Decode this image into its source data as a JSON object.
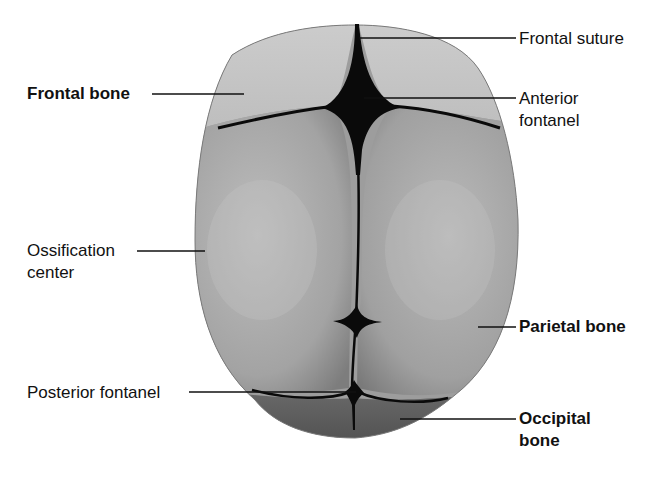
{
  "figure": {
    "colors": {
      "background": "#ffffff",
      "bone_light": "#c9c9c9",
      "bone_mid": "#a8a8a8",
      "bone_dark": "#6e6e6e",
      "suture": "#0a0a0a",
      "leader_line": "#111111",
      "text": "#111111"
    }
  },
  "labels": {
    "frontal_bone": {
      "text": "Frontal bone",
      "bold": true,
      "side": "left"
    },
    "frontal_suture": {
      "text": "Frontal suture",
      "bold": false,
      "side": "right"
    },
    "anterior_fontanel": {
      "line1": "Anterior",
      "line2": "fontanel",
      "bold": false,
      "side": "right"
    },
    "ossification_center": {
      "line1": "Ossification",
      "line2": "center",
      "bold": false,
      "side": "left"
    },
    "parietal_bone": {
      "text": "Parietal bone",
      "bold": true,
      "side": "right"
    },
    "posterior_fontanel": {
      "text": "Posterior fontanel",
      "bold": false,
      "side": "left"
    },
    "occipital_bone": {
      "line1": "Occipital",
      "line2": "bone",
      "bold": true,
      "side": "right"
    }
  }
}
